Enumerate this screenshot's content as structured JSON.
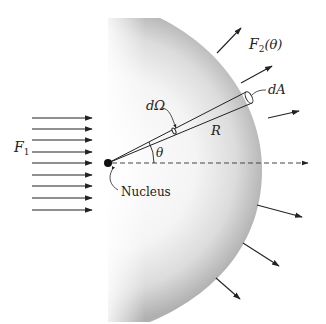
{
  "diagram": {
    "labels": {
      "incident_flux": "F",
      "incident_flux_sub": "1",
      "scattered_flux": "F",
      "scattered_flux_sub": "2",
      "scattered_flux_arg": "(θ)",
      "area_element": "dA",
      "solid_angle": "dΩ",
      "radius": "R",
      "angle": "θ",
      "target": "Nucleus"
    },
    "incident_arrows": 9,
    "scattered_arrows": 7,
    "colors": {
      "ink": "#222222",
      "sphere_light": "#ffffff",
      "sphere_dark": "#b8b8b8"
    }
  }
}
